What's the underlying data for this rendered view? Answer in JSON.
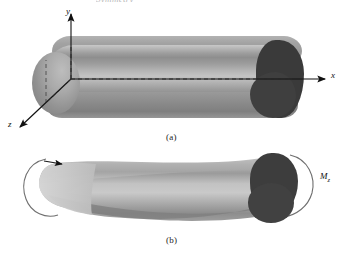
{
  "figure": {
    "cut_heading": "Symmetry",
    "background_color": "#ffffff",
    "panels": [
      {
        "id": "a",
        "caption": "(a)",
        "description": "straight three-dimensional prismatic beam with coordinate axes at the left end",
        "axes": [
          {
            "name": "y-axis",
            "label": "y",
            "direction": "up"
          },
          {
            "name": "x-axis",
            "label": "x",
            "direction": "right"
          },
          {
            "name": "z-axis",
            "label": "z",
            "direction": "down-left"
          }
        ],
        "beam": {
          "body_color_light": "#c3c3c3",
          "body_color_mid": "#9e9e9e",
          "body_color_dark": "#7f7f7f",
          "end_cap_color": "#3a3a3a",
          "centerline_style": "dashed"
        }
      },
      {
        "id": "b",
        "caption": "(b)",
        "description": "same beam shown bent (deformed) under an applied end bending moment",
        "moment_label": "M",
        "moment_subscript": "z",
        "moment_arrow": "curved-ellipse-arrow",
        "beam": {
          "body_color_light": "#cdcdcd",
          "body_color_mid": "#a5a5a5",
          "body_color_dark": "#858585",
          "end_cap_color": "#3d3d3d"
        }
      }
    ]
  }
}
